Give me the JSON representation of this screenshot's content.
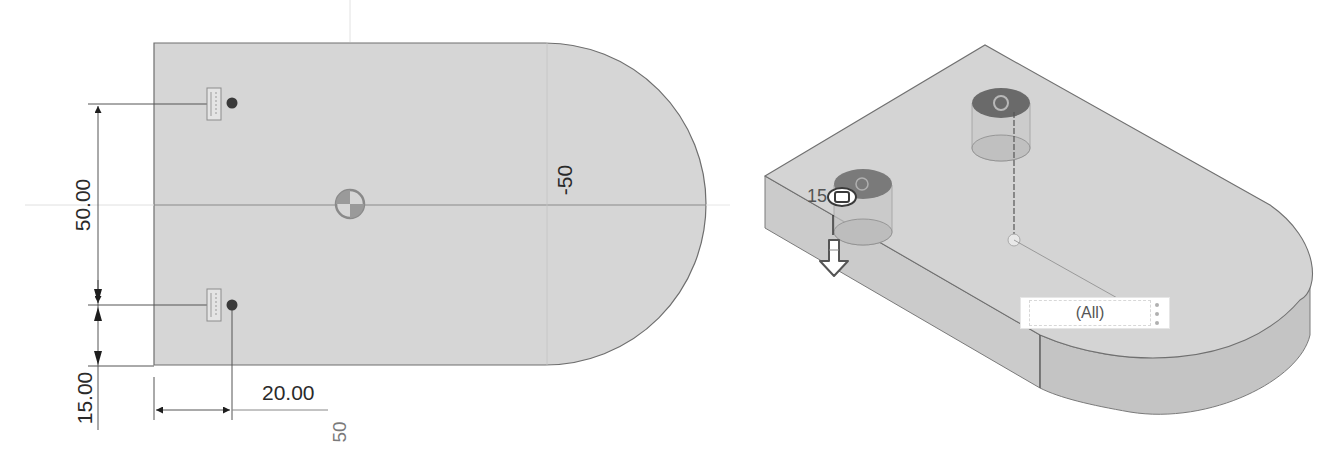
{
  "sketch_view": {
    "dimensions": {
      "vertical_hole_spacing": "50.00",
      "vertical_edge_offset": "15.00",
      "horizontal_edge_offset": "20.00",
      "horizontal_ref_value": "50",
      "centerline_value": "-50"
    },
    "colors": {
      "body_fill": "#d6d6d6",
      "outline": "#6e6e6e",
      "dimension_line": "#555555",
      "hole_point": "#3a3a3a"
    }
  },
  "model_view": {
    "hole_depth_label": "15",
    "colors": {
      "top_face": "#d4d4d4",
      "side_face": "#c6c6c6",
      "edge": "#707070",
      "hole_top": "#6a6a6a"
    }
  },
  "filter_toolbar": {
    "selection_filter_label": "(All)",
    "more_menu_icon": "vertical-ellipsis-icon"
  }
}
